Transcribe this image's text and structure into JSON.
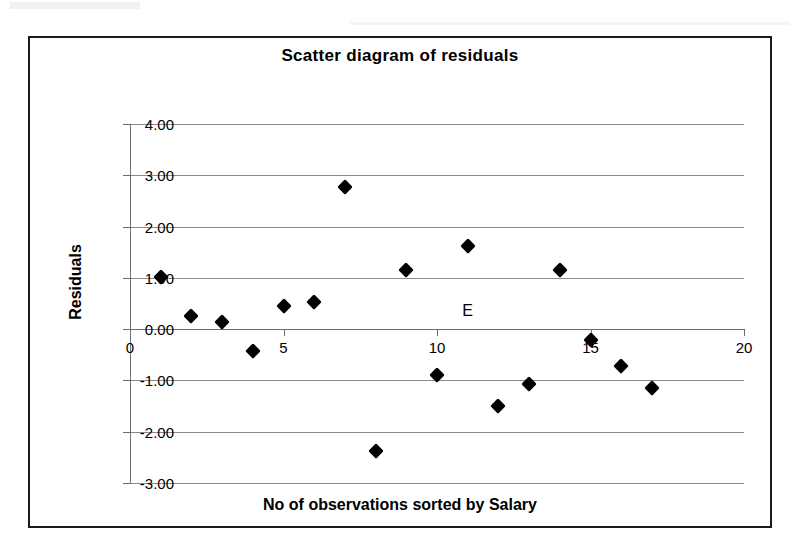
{
  "chart_data": {
    "type": "scatter",
    "title": "Scatter diagram of residuals",
    "xlabel": "No of observations sorted by Salary",
    "ylabel": "Residuals",
    "xlim": [
      0,
      20
    ],
    "ylim": [
      -3.0,
      4.0
    ],
    "xticks": [
      "0",
      "5",
      "10",
      "15",
      "20"
    ],
    "xtick_values": [
      0,
      5,
      10,
      15,
      20
    ],
    "yticks": [
      "4.00",
      "3.00",
      "2.00",
      "1.00",
      "0.00",
      "-1.00",
      "-2.00",
      "-3.00"
    ],
    "ytick_values": [
      4,
      3,
      2,
      1,
      0,
      -1,
      -2,
      -3
    ],
    "grid": "horizontal",
    "legend": "none",
    "annotation": "E",
    "annotation_x": 11.0,
    "annotation_y": 0.35,
    "marker": "diamond",
    "marker_color": "#000000",
    "series": [
      {
        "name": "Residuals",
        "x": [
          1,
          2,
          3,
          4,
          5,
          6,
          7,
          8,
          9,
          10,
          11,
          12,
          13,
          14,
          15,
          16,
          17
        ],
        "y": [
          1.02,
          0.25,
          0.13,
          -0.43,
          0.46,
          0.53,
          2.78,
          -2.37,
          1.15,
          -0.9,
          1.63,
          -1.49,
          -1.07,
          1.15,
          -0.22,
          -0.72,
          -1.14
        ]
      }
    ]
  },
  "style": {
    "frame_color": "#1a1a1a",
    "gridline_color": "#8a8a8a",
    "axis_color": "#6e6e6e",
    "background": "#ffffff"
  }
}
